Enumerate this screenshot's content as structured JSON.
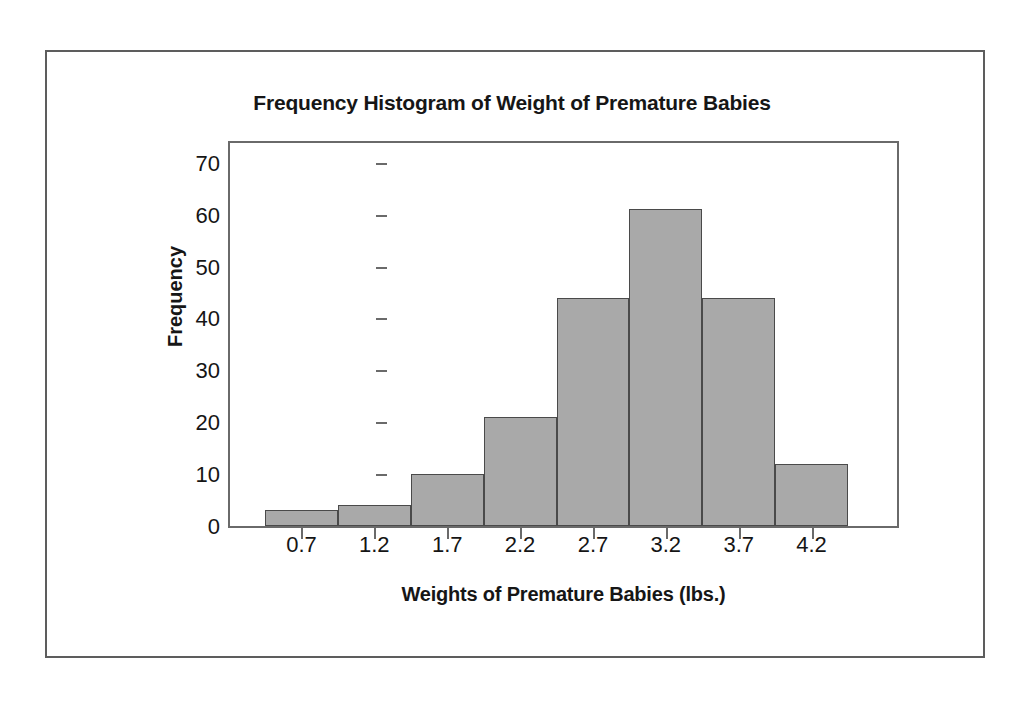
{
  "chart_data": {
    "type": "bar",
    "title": "Frequency Histogram of Weight of Premature Babies",
    "xlabel": "Weights of Premature Babies (lbs.)",
    "ylabel": "Frequency",
    "categories": [
      "0.7",
      "1.2",
      "1.7",
      "2.2",
      "2.7",
      "3.2",
      "3.7",
      "4.2"
    ],
    "values": [
      3,
      4,
      10,
      21,
      44,
      61,
      44,
      12
    ],
    "xticklabels": [
      "0.7",
      "1.2",
      "1.7",
      "2.2",
      "2.7",
      "3.2",
      "3.7",
      "4.2"
    ],
    "yticklabels": [
      "0",
      "10",
      "20",
      "30",
      "40",
      "50",
      "60",
      "70"
    ],
    "ytickvalues": [
      0,
      10,
      20,
      30,
      40,
      50,
      60,
      70
    ],
    "ylim": [
      0,
      74
    ],
    "grid": false,
    "legend": false,
    "bar_fill_color": "#a9a9a9",
    "bar_edge_color": "#4a4a4a",
    "frame_color": "#6a6a6a",
    "text_color": "#161616",
    "background_color": "#ffffff"
  },
  "figure": {
    "title": "Frequency Histogram of Weight of Premature Babies",
    "x_axis_title": "Weights of Premature Babies (lbs.)",
    "y_axis_title": "Frequency"
  }
}
